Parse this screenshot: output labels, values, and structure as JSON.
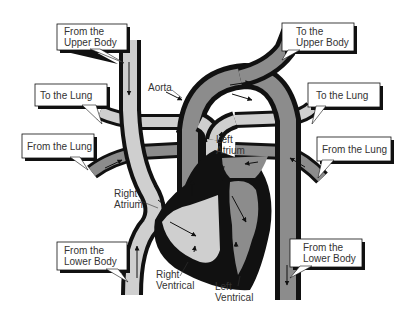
{
  "diagram": {
    "type": "heart-circulation",
    "colors": {
      "background": "#ffffff",
      "outline": "#111111",
      "deoxygenated": "#cfcfcf",
      "oxygenated": "#8c8c8c",
      "callout_fill": "#ffffff",
      "callout_shadow": "#111111",
      "text": "#333333"
    },
    "callouts": {
      "from_upper_body": {
        "line1": "From the",
        "line2": "Upper Body"
      },
      "to_upper_body": {
        "line1": "To the",
        "line2": "Upper Body"
      },
      "to_lung_left": {
        "line1": "To the Lung"
      },
      "to_lung_right": {
        "line1": "To the Lung"
      },
      "from_lung_left": {
        "line1": "From the Lung"
      },
      "from_lung_right": {
        "line1": "From the Lung"
      },
      "from_lower_body_left": {
        "line1": "From the",
        "line2": "Lower Body"
      },
      "from_lower_body_right": {
        "line1": "From the",
        "line2": "Lower Body"
      }
    },
    "labels": {
      "aorta": "Aorta",
      "left_atrium": {
        "line1": "Left",
        "line2": "Atrium"
      },
      "right_atrium": {
        "line1": "Right",
        "line2": "Atrium"
      },
      "right_ventricle": {
        "line1": "Right",
        "line2": "Ventrical"
      },
      "left_ventricle": {
        "line1": "Left",
        "line2": "Ventrical"
      }
    }
  }
}
